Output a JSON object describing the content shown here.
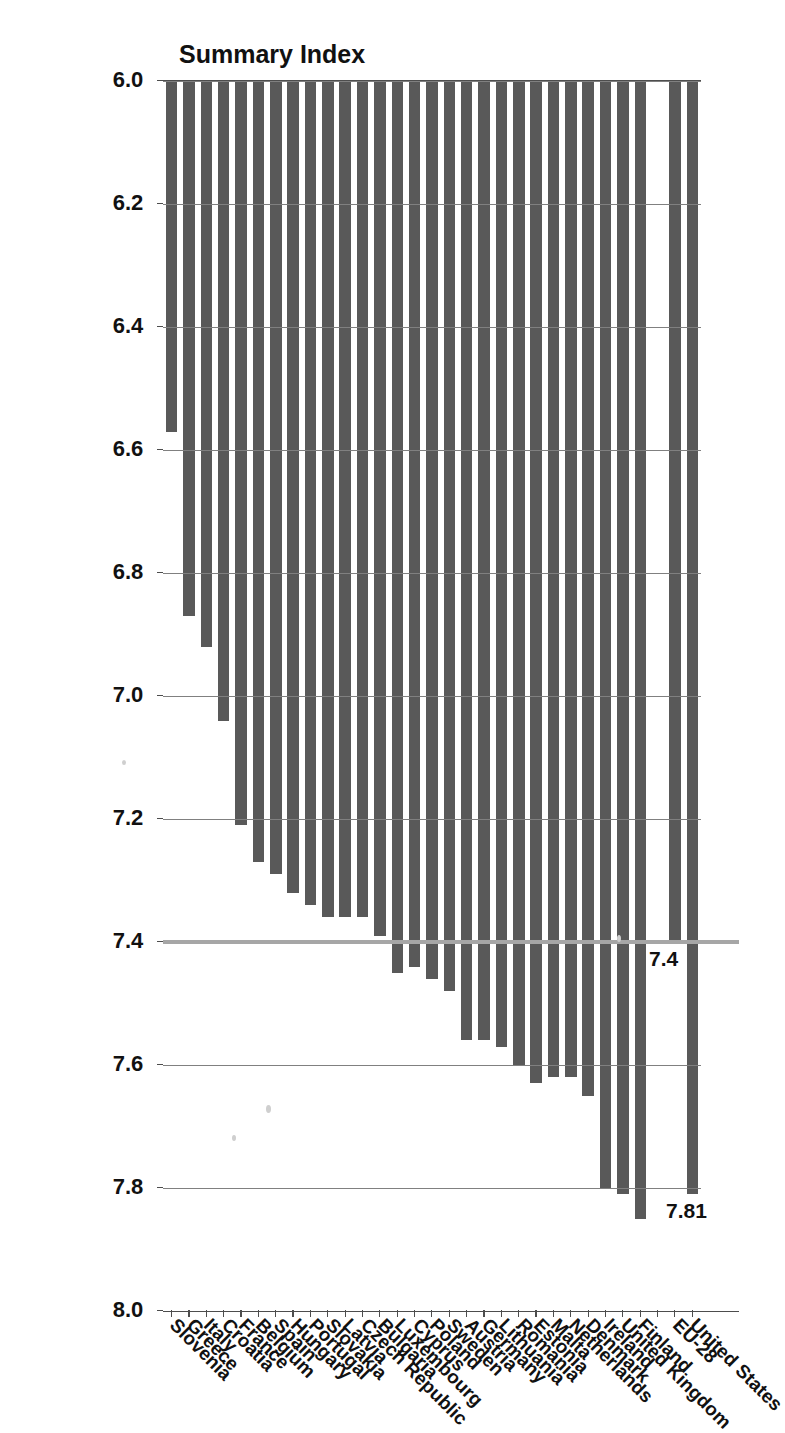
{
  "chart_data": {
    "type": "bar",
    "orientation": "horizontal",
    "title": "Summary Index",
    "xlabel": "",
    "ylabel": "",
    "axis_min": 6.0,
    "axis_max": 8.0,
    "axis_tick_step": 0.2,
    "tick_labels": [
      "8.0",
      "7.8",
      "7.6",
      "7.4",
      "7.2",
      "7.0",
      "6.8",
      "6.6",
      "6.4",
      "6.2",
      "6.0"
    ],
    "grid": true,
    "legend": "none",
    "bar_color": "#595959",
    "reference_line": {
      "value": 7.4,
      "label": "7.4",
      "color": "#a6a6a6"
    },
    "annotations": [
      {
        "label": "7.81",
        "target": "United States"
      },
      {
        "label": "7.4",
        "target": "EU-28"
      }
    ],
    "categories": [
      "United States",
      "EU-28",
      "",
      "Finland",
      "United Kingdom",
      "Ireland",
      "Denmark",
      "Netherlands",
      "Malta",
      "Estonia",
      "Romania",
      "Lithuania",
      "Germany",
      "Austria",
      "Sweden",
      "Poland",
      "Cyprus",
      "Luxembourg",
      "Bulgaria",
      "Czech Republic",
      "Latvia",
      "Slovakia",
      "Portugal",
      "Hungary",
      "Spain",
      "Belgium",
      "France",
      "Croatia",
      "Italy",
      "Greece",
      "Slovenia"
    ],
    "values": [
      7.81,
      7.4,
      null,
      7.85,
      7.81,
      7.8,
      7.65,
      7.62,
      7.62,
      7.63,
      7.6,
      7.57,
      7.56,
      7.56,
      7.48,
      7.46,
      7.44,
      7.45,
      7.39,
      7.36,
      7.36,
      7.36,
      7.34,
      7.32,
      7.29,
      7.27,
      7.21,
      7.04,
      6.92,
      6.87,
      6.57
    ]
  }
}
